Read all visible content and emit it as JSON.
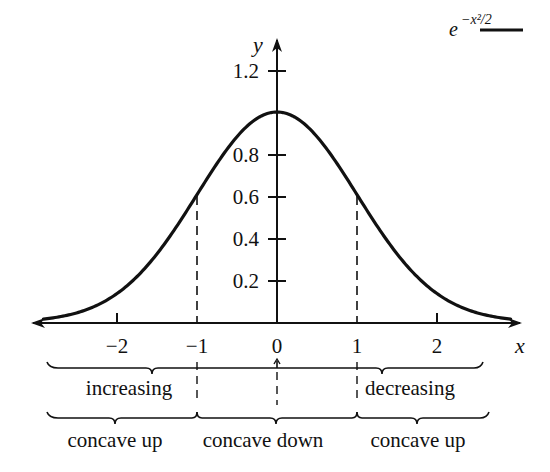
{
  "chart_data": {
    "type": "line",
    "title": "",
    "xlabel": "x",
    "ylabel": "y",
    "xlim": [
      -3,
      3
    ],
    "ylim": [
      0,
      1.3
    ],
    "grid": false,
    "legend": {
      "position": "top-right",
      "entries": [
        {
          "label": "e^{-x^2/2}",
          "style": "solid black line"
        }
      ]
    },
    "x_ticks": [
      -2,
      -1,
      0,
      1,
      2
    ],
    "x_tick_labels": [
      "−2",
      "−1",
      "0",
      "1",
      "2"
    ],
    "y_ticks": [
      0.2,
      0.4,
      0.6,
      0.8,
      1.2
    ],
    "y_tick_labels": [
      "0.2",
      "0.4",
      "0.6",
      "0.8",
      "1.2"
    ],
    "series": [
      {
        "name": "e^{-x^2/2}",
        "function": "exp(-x^2/2)",
        "x": [
          -2.9,
          -2.5,
          -2,
          -1.5,
          -1,
          -0.5,
          0,
          0.5,
          1,
          1.5,
          2,
          2.5,
          2.9
        ],
        "values": [
          0.015,
          0.044,
          0.135,
          0.325,
          0.607,
          0.882,
          1.0,
          0.882,
          0.607,
          0.325,
          0.135,
          0.044,
          0.015
        ]
      }
    ],
    "annotations": [
      {
        "type": "dashed-vertical",
        "x": -1,
        "to_y": 0.607
      },
      {
        "type": "dashed-vertical",
        "x": 1,
        "to_y": 0.607
      }
    ],
    "regions": {
      "monotonicity": [
        {
          "label": "increasing",
          "from": -3,
          "to": 0
        },
        {
          "label": "decreasing",
          "from": 0,
          "to": 3
        }
      ],
      "concavity": [
        {
          "label": "concave up",
          "from": -3,
          "to": -1
        },
        {
          "label": "concave down",
          "from": -1,
          "to": 1
        },
        {
          "label": "concave up",
          "from": 1,
          "to": 3
        }
      ]
    }
  },
  "axes": {
    "x_label": "x",
    "y_label": "y",
    "x_ticks": [
      {
        "label": "−2",
        "px": 117
      },
      {
        "label": "−1",
        "px": 197
      },
      {
        "label": "0",
        "px": 277
      },
      {
        "label": "1",
        "px": 357
      },
      {
        "label": "2",
        "px": 437
      }
    ],
    "y_ticks": [
      {
        "label": "0.2",
        "py": 281
      },
      {
        "label": "0.4",
        "py": 239
      },
      {
        "label": "0.6",
        "py": 197
      },
      {
        "label": "0.8",
        "py": 155
      },
      {
        "label": "1.2",
        "py": 71
      }
    ]
  },
  "legend": {
    "base": "e",
    "exponent": "−x²/2"
  },
  "labels": {
    "increasing": "increasing",
    "decreasing": "decreasing",
    "concave_up_left": "concave up",
    "concave_down": "concave down",
    "concave_up_right": "concave up"
  },
  "colors": {
    "ink": "#111111",
    "background": "#ffffff"
  }
}
